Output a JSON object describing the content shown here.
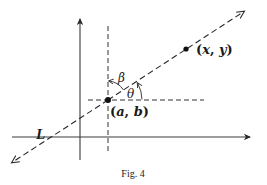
{
  "figure": {
    "caption": "Fig. 4",
    "line_label": "L",
    "point_given": {
      "label_open": "(",
      "label_a": "a",
      "label_comma": ", ",
      "label_b": "b",
      "label_close": ")",
      "full_label": "(a, b)"
    },
    "point_general": {
      "label_open": "(",
      "label_x": "x",
      "label_comma": ", ",
      "label_y": "y",
      "label_close": ")",
      "full_label": "(x, y)"
    },
    "angle_from_vertical": "β",
    "angle_from_horizontal": "θ"
  },
  "colors": {
    "stroke": "#2a2a2a",
    "background": "#ffffff"
  }
}
